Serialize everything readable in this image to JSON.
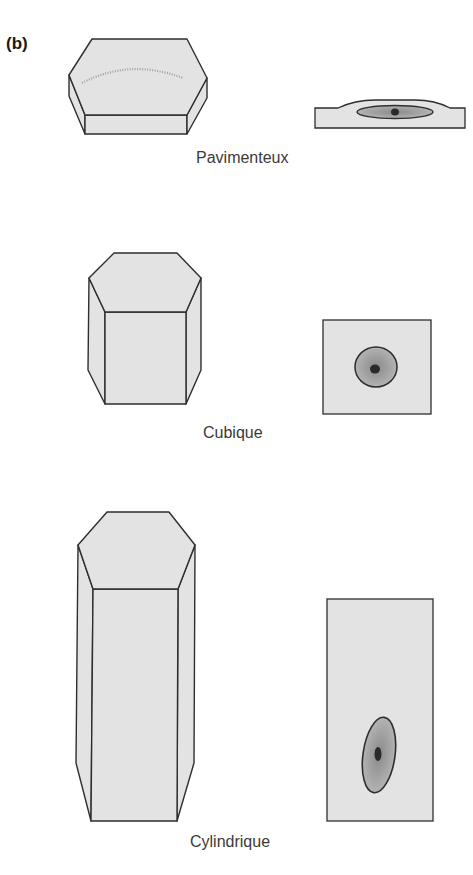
{
  "panel_label": "(b)",
  "colors": {
    "cell_fill": "#e3e3e3",
    "outline": "#2e2e2e",
    "nucleus_fill": "#a9a9a9",
    "chromatin": "#2a2a2a",
    "label_text": "#3a3a3a"
  },
  "rows": [
    {
      "name": "squamous",
      "label": "Pavimenteux"
    },
    {
      "name": "cuboidal",
      "label": "Cubique"
    },
    {
      "name": "columnar",
      "label": "Cylindrique"
    }
  ]
}
